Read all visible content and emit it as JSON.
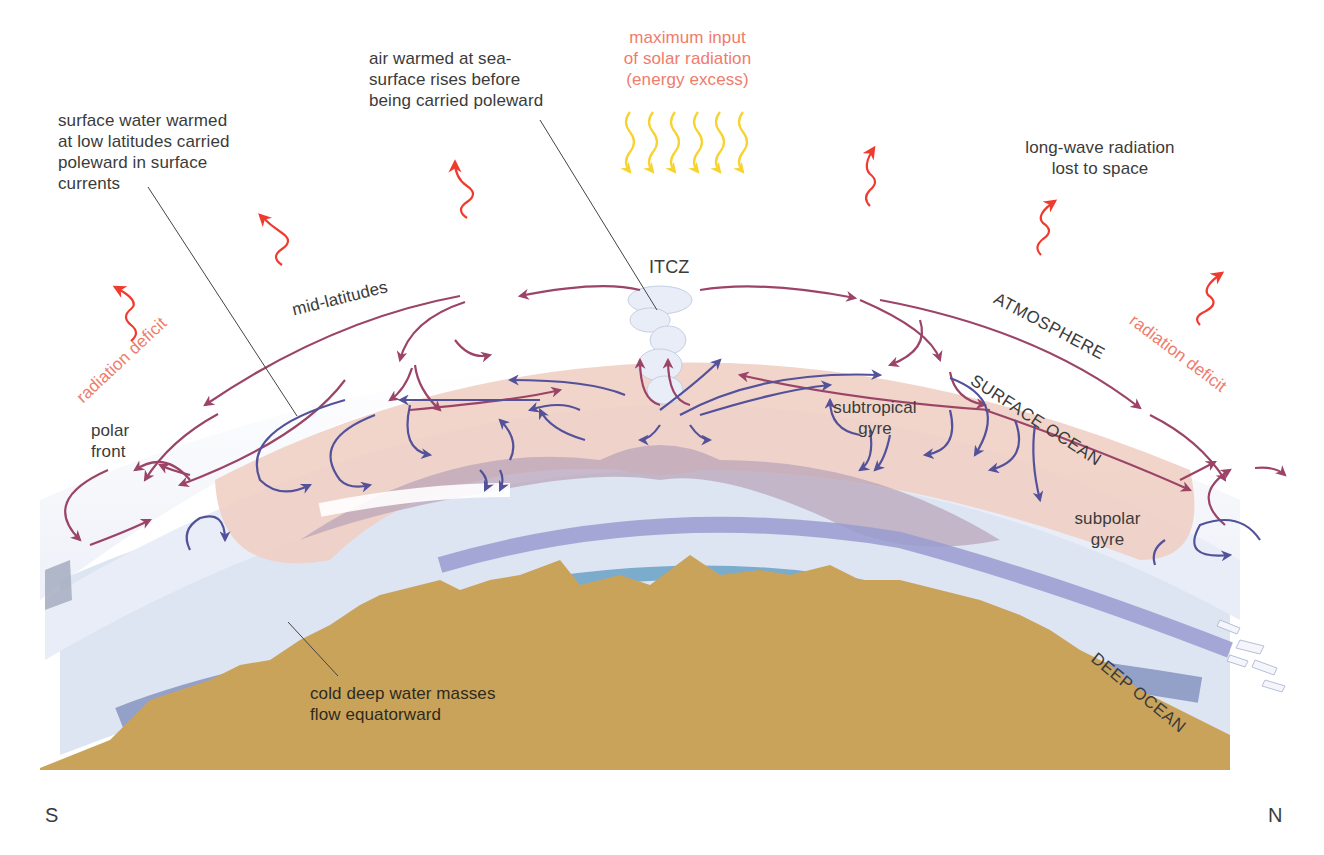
{
  "colors": {
    "atmosphere_arrow": "#9b4468",
    "ocean_arrow": "#53519a",
    "radiation_out": "#f03a2e",
    "solar_in": "#f7d330",
    "red_text": "#ef7c6c",
    "text": "#3b3b3b",
    "surface_ocean": "#f0cfc4",
    "surface_ocean_shadow": "#b8a2b8",
    "deep_ocean": "#dde4f2",
    "deep_current_upper": "#9a9cd0",
    "deep_current_lower": "#6aa2c6",
    "deep_current_polar": "#7a8ab8",
    "seafloor": "#c9a35a"
  },
  "labels": {
    "surface_water": [
      "surface water warmed",
      "at low latitudes carried",
      "poleward in surface",
      "currents"
    ],
    "air_warmed": [
      "air warmed at sea-",
      "surface rises before",
      "being carried poleward"
    ],
    "solar_input": [
      "maximum input",
      "of solar radiation",
      "(energy excess)"
    ],
    "longwave": [
      "long-wave radiation",
      "lost to space"
    ],
    "itcz": "ITCZ",
    "mid_latitudes": "mid-latitudes",
    "radiation_deficit_left": "radiation deficit",
    "radiation_deficit_right": "radiation deficit",
    "atmosphere": "ATMOSPHERE",
    "surface_ocean": "SURFACE OCEAN",
    "deep_ocean": "DEEP OCEAN",
    "polar_front": [
      "polar",
      "front"
    ],
    "subtropical_gyre": [
      "subtropical",
      "gyre"
    ],
    "subpolar_gyre": [
      "subpolar",
      "gyre"
    ],
    "cold_deep_water": [
      "cold deep water masses",
      "flow equatorward"
    ],
    "south": "S",
    "north": "N"
  },
  "icons": {
    "solar_rays": "wavy-down-arrow x6",
    "longwave_rays": "wavy-up-arrow x6",
    "itcz_cloud": "cumulus-cloud",
    "sea_ice": "ice-floes"
  }
}
